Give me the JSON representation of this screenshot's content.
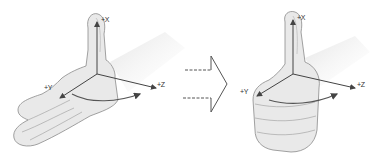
{
  "figure": {
    "colors": {
      "skin_fill": "#e9e9e9",
      "skin_shade": "#d2d2d2",
      "outline": "#8a8a8a",
      "axis": "#444444",
      "rotation_arrow": "#555555",
      "transition_arrow": "#555555"
    },
    "left_panel": {
      "name": "open-hand",
      "labels": {
        "x": "+X",
        "y": "+Y",
        "z": "+Z"
      }
    },
    "transition": {
      "name": "transition-arrow",
      "style": "dashed-outline-arrow"
    },
    "right_panel": {
      "name": "thumbs-up-fist",
      "labels": {
        "x": "+X",
        "y": "+Y",
        "z": "+Z"
      }
    }
  }
}
